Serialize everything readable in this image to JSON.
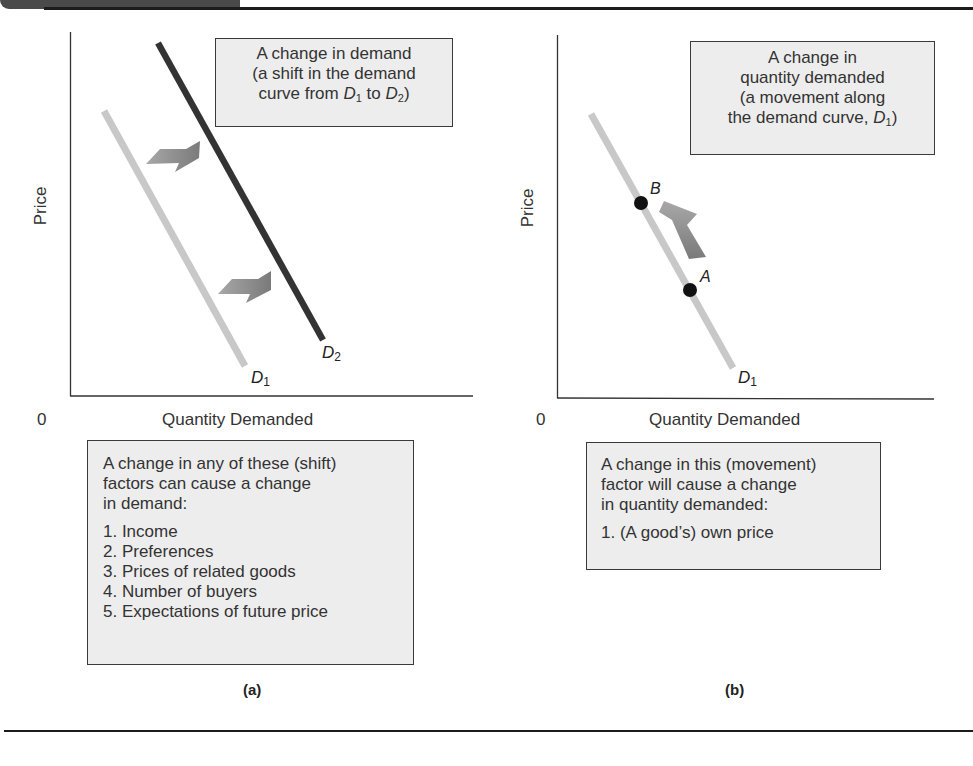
{
  "figure": {
    "panels": [
      {
        "id": "a",
        "label": "(a)",
        "y_axis_label": "Price",
        "x_axis_label": "Quantity Demanded",
        "origin_label": "0",
        "curves": [
          {
            "name": "D",
            "subscript": "1",
            "color": "#c8c8c8"
          },
          {
            "name": "D",
            "subscript": "2",
            "color": "#333333"
          }
        ],
        "callout": {
          "line1": "A change in demand",
          "line2": "(a shift in the demand",
          "line3_prefix": "curve from ",
          "line3_d1": "D",
          "line3_d1_sub": "1",
          "line3_mid": " to ",
          "line3_d2": "D",
          "line3_d2_sub": "2",
          "line3_suffix": ")"
        },
        "factors_box": {
          "intro_lines": [
            "A change in any of these (shift)",
            "factors can cause a change",
            "in demand:"
          ],
          "items": [
            "1. Income",
            "2. Preferences",
            "3. Prices of related goods",
            "4. Number of buyers",
            "5. Expectations of future price"
          ]
        }
      },
      {
        "id": "b",
        "label": "(b)",
        "y_axis_label": "Price",
        "x_axis_label": "Quantity Demanded",
        "origin_label": "0",
        "curves": [
          {
            "name": "D",
            "subscript": "1",
            "color": "#c8c8c8"
          }
        ],
        "points": [
          {
            "name": "B"
          },
          {
            "name": "A"
          }
        ],
        "callout": {
          "line1": "A change in",
          "line2": "quantity demanded",
          "line3": "(a movement along",
          "line4_prefix": "the demand curve, ",
          "line4_d": "D",
          "line4_d_sub": "1",
          "line4_suffix": ")"
        },
        "factors_box": {
          "intro_lines": [
            "A change in this (movement)",
            "factor will cause a change",
            "in quantity demanded:"
          ],
          "items": [
            "1. (A good’s) own price"
          ]
        }
      }
    ],
    "colors": {
      "box_fill": "#ededed",
      "arrow_fill": "#8a8a8a",
      "light_curve": "#c8c8c8",
      "dark_curve": "#333333"
    }
  }
}
